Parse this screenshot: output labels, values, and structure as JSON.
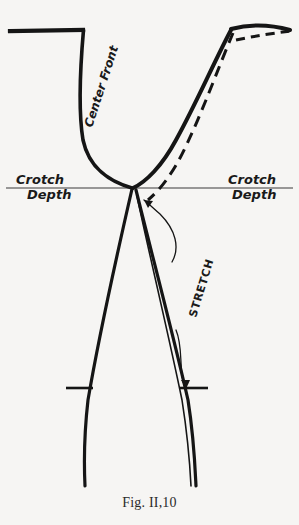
{
  "figure": {
    "caption": "Fig. II,10",
    "caption_top": 495,
    "background_color": "#f6f5f3",
    "ink_color": "#151515",
    "labels": {
      "center_front": "Center Front",
      "crotch_left_line1": "Crotch",
      "crotch_left_line2": "Depth",
      "crotch_right_line1": "Crotch",
      "crotch_right_line2": "Depth",
      "stretch": "STRETCH"
    },
    "geometry": {
      "waistband_left": "M 10,31 L 83,30",
      "front_rise": "M 83.5,30 C 80,70 78,110 83,140 C 89,168 110,182 132,188",
      "waistband_right_solid": "M 231,29 C 250,24 272,25 290,30",
      "waistband_right_dashed": "M 236,40 C 255,36 274,33 291,31",
      "back_rise_solid": "M 231,30 C 214,62 196,104 176,140 C 162,166 146,182 133,188",
      "back_rise_dashed": "M 233,33 C 219,66 204,108 186,146 C 174,172 160,190 148,200",
      "left_inseam": "M 132,189 C 118,250 100,330 88,400 C 84,435 84,465 85,486",
      "right_inseam_outer": "M 136,190 C 152,255 172,330 188,400 C 194,438 195,466 196,486",
      "right_inseam_inner": "M 137,196 C 150,258 168,332 182,400 C 188,438 190,466 191,486",
      "crotch_depth_line": "M 6,188 L 293,188",
      "notch_left": "M 66,388 L 93,388",
      "notch_right": "M 180,388 L 208,388",
      "stretch_leader": "M 172,262 C 180,248 176,230 160,214 C 152,207 148,203 144,200",
      "stretch_leader_arrow": "M 144,200 L 153,201 L 148,208 Z",
      "stretch_leader_lower": "M 176,330 C 182,344 180,360 182,376 C 183,381 184,384 185,387",
      "stretch_leader_lower_arrow": "M 186,389 L 181,380 L 190,380 Z"
    },
    "label_positions": {
      "center_front": {
        "x": 92,
        "y": 128,
        "rotation": -72,
        "font_size": 12
      },
      "crotch_left": {
        "x": 10,
        "y": 182,
        "font_size": 13
      },
      "crotch_right": {
        "x": 228,
        "y": 182,
        "font_size": 13
      },
      "stretch": {
        "x": 196,
        "y": 318,
        "rotation": -73,
        "font_size": 11
      }
    }
  }
}
